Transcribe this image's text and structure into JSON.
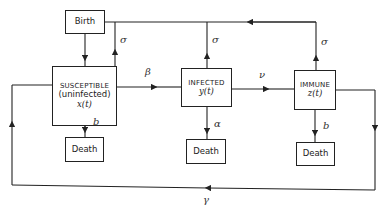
{
  "diagram": {
    "nodes": {
      "birth": {
        "label": "Birth"
      },
      "susceptible": {
        "label": "SUSCEPTIBLE",
        "sublabel": "(uninfected)",
        "var": "x(t)"
      },
      "infected": {
        "label": "INFECTED",
        "var": "y(t)"
      },
      "immune": {
        "label": "IMMUNE",
        "var": "z(t)"
      },
      "death_s": {
        "label": "Death"
      },
      "death_i": {
        "label": "Death"
      },
      "death_r": {
        "label": "Death"
      }
    },
    "edges": {
      "birth_to_susceptible": "",
      "susceptible_to_birth": "σ",
      "infected_to_birth": "σ",
      "immune_to_birth": "σ",
      "susceptible_to_infected": "β",
      "infected_to_immune": "ν",
      "susceptible_to_death": "b",
      "infected_to_death": "α",
      "immune_to_death": "b",
      "immune_to_susceptible": "γ"
    },
    "colors": {
      "line": "#222222",
      "background": "#ffffff"
    }
  }
}
